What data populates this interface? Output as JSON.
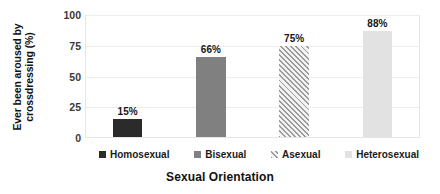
{
  "chart_data": {
    "type": "bar",
    "title": "",
    "xlabel": "Sexual Orientation",
    "ylabel": "Ever been aroused by crossdressing (%)",
    "categories": [
      "Homosexual",
      "Bisexual",
      "Asexual",
      "Heterosexual"
    ],
    "values": [
      15,
      66,
      75,
      88
    ],
    "data_labels": [
      "15%",
      "66%",
      "75%",
      "88%"
    ],
    "ylim": [
      0,
      100
    ],
    "yticks": [
      0,
      25,
      50,
      75,
      100
    ],
    "ytick_labels": [
      "0",
      "25",
      "50",
      "75",
      "100"
    ],
    "grid": "horizontal",
    "legend_position": "bottom",
    "series": [
      {
        "name": "Homosexual",
        "value": 15,
        "label": "15%",
        "fill": "#2b2b2b",
        "pattern": "solid"
      },
      {
        "name": "Bisexual",
        "value": 66,
        "label": "66%",
        "fill": "#808080",
        "pattern": "solid"
      },
      {
        "name": "Asexual",
        "value": 75,
        "label": "75%",
        "fill": "#f2f2f2",
        "pattern": "diagonal-hatch"
      },
      {
        "name": "Heterosexual",
        "value": 88,
        "label": "88%",
        "fill": "#e2e2e2",
        "pattern": "solid"
      }
    ]
  },
  "axes": {
    "y_title": "Ever been aroused by crossdressing (%)",
    "y_title_line1": "Ever been aroused",
    "y_title_line2": "by crossdressing (%)",
    "x_title": "Sexual Orientation"
  },
  "legend": {
    "items": [
      {
        "label": "Homosexual",
        "color": "#2b2b2b",
        "pattern": "solid"
      },
      {
        "label": "Bisexual",
        "color": "#808080",
        "pattern": "solid"
      },
      {
        "label": "Asexual",
        "color": "#f2f2f2",
        "pattern": "diagonal-hatch"
      },
      {
        "label": "Heterosexual",
        "color": "#e2e2e2",
        "pattern": "solid"
      }
    ]
  },
  "colors": {
    "gridline": "#ededed",
    "plot_border": "#e6e6e6",
    "text": "#1a1a1a",
    "background": "#ffffff"
  }
}
